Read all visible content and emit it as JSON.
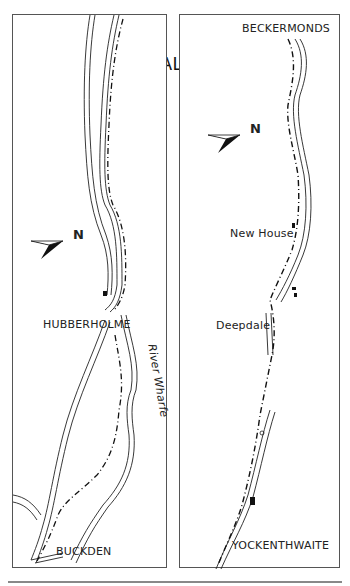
{
  "title": "WALK 20",
  "panels": {
    "left": {
      "places": [
        {
          "name": "HUBBERHOLME"
        },
        {
          "name": "BUCKDEN"
        }
      ],
      "river_label": "River Wharfe",
      "north_arrow": {
        "label": "N"
      }
    },
    "right": {
      "places": [
        {
          "name": "BECKERMONDS"
        },
        {
          "name": "New House"
        },
        {
          "name": "Deepdale"
        },
        {
          "name": "YOCKENTHWAITE"
        }
      ],
      "north_arrow": {
        "label": "N"
      }
    }
  },
  "colors": {
    "ink": "#222222",
    "border": "#555555",
    "background": "#ffffff"
  }
}
